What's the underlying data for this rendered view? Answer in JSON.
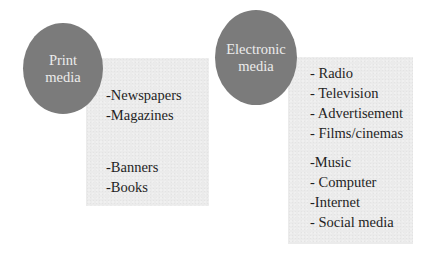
{
  "colors": {
    "circle_fill": "#7b7b7b",
    "circle_text": "#ececec",
    "box_fill": "#ebebeb",
    "list_text": "#1f1f1f",
    "background": "#ffffff"
  },
  "print_media": {
    "title_line1": "Print",
    "title_line2": "media",
    "groups": [
      {
        "items": [
          "-Newspapers",
          "-Magazines"
        ]
      },
      {
        "items": [
          "-Banners",
          "-Books"
        ]
      }
    ]
  },
  "electronic_media": {
    "title_line1": "Electronic",
    "title_line2": "media",
    "groups": [
      {
        "items": [
          "- Radio",
          "- Television",
          "- Advertisement",
          "- Films/cinemas"
        ]
      },
      {
        "items": [
          "-Music",
          "- Computer",
          "-Internet",
          "- Social media"
        ]
      }
    ]
  }
}
